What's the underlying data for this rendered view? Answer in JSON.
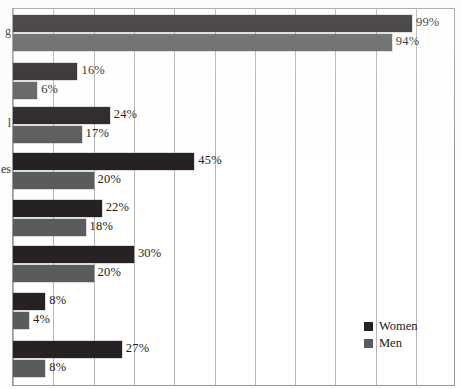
{
  "chart_data": {
    "type": "bar",
    "orientation": "horizontal",
    "title": "",
    "xlabel": "",
    "ylabel": "",
    "xlim": [
      0,
      110
    ],
    "grid": true,
    "grid_axis": "x",
    "gridline_values": [
      0,
      10,
      20,
      30,
      40,
      50,
      60,
      70,
      80,
      90,
      100,
      110
    ],
    "legend_position": "bottom-right",
    "value_suffix": "%",
    "categories": [
      "g",
      "",
      "l",
      "es",
      "",
      "",
      "",
      ""
    ],
    "category_labels_truncated": true,
    "series": [
      {
        "name": "Women",
        "color": "#262224",
        "values": [
          99,
          16,
          24,
          45,
          22,
          30,
          8,
          27
        ],
        "labels": [
          "99%",
          "16%",
          "24%",
          "45%",
          "22%",
          "30%",
          "8%",
          "27%"
        ]
      },
      {
        "name": "Men",
        "color": "#5a5b5d",
        "values": [
          94,
          6,
          17,
          20,
          18,
          20,
          4,
          8
        ],
        "labels": [
          "94%",
          "6%",
          "17%",
          "20%",
          "18%",
          "20%",
          "4%",
          "8%"
        ]
      }
    ]
  },
  "legend": {
    "items": [
      {
        "label": "Women",
        "color": "#262224"
      },
      {
        "label": "Men",
        "color": "#5a5b5d"
      }
    ]
  },
  "colors": {
    "women": "#262224",
    "men": "#5a5b5d",
    "gridline": "#b5b5b5",
    "frame": "#9a9a9a",
    "background": "#ffffff",
    "text": "#1b1b1b"
  }
}
